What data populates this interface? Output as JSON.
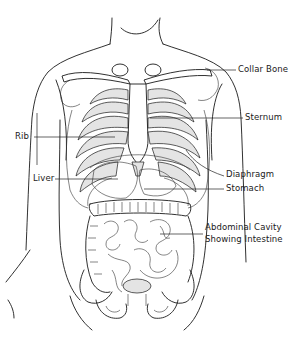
{
  "diagram": {
    "labels": [
      {
        "id": "collar-bone",
        "text": "Collar Bone",
        "side": "right"
      },
      {
        "id": "sternum",
        "text": "Sternum",
        "side": "right"
      },
      {
        "id": "rib",
        "text": "Rib",
        "side": "left"
      },
      {
        "id": "liver",
        "text": "Liver",
        "side": "left"
      },
      {
        "id": "diaphragm",
        "text": "Diaphragm",
        "side": "right"
      },
      {
        "id": "stomach",
        "text": "Stomach",
        "side": "right"
      },
      {
        "id": "abdominal-cavity",
        "text": "Abdominal Cavity",
        "side": "right"
      },
      {
        "id": "abdominal-cavity-2",
        "text": "Showing Intestine",
        "side": "right"
      }
    ],
    "colors": {
      "line": "#1a1a1a",
      "background": "#ffffff",
      "shade": "#e4e4e4"
    }
  }
}
